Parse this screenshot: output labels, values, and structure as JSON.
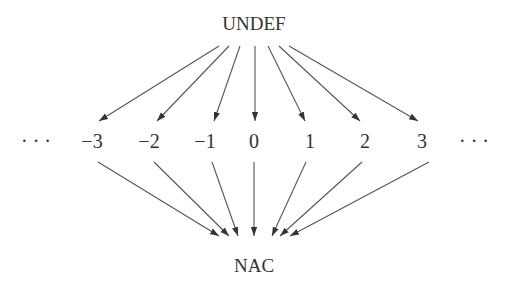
{
  "diagram": {
    "type": "lattice",
    "top": {
      "label": "UNDEF"
    },
    "bottom": {
      "label": "NAC"
    },
    "middle": {
      "left_ellipsis": "· · ·",
      "right_ellipsis": "· · ·",
      "values": [
        "−3",
        "−2",
        "−1",
        "0",
        "1",
        "2",
        "3"
      ]
    },
    "edges": [
      {
        "from": "UNDEF",
        "to": "−3"
      },
      {
        "from": "UNDEF",
        "to": "−2"
      },
      {
        "from": "UNDEF",
        "to": "−1"
      },
      {
        "from": "UNDEF",
        "to": "0"
      },
      {
        "from": "UNDEF",
        "to": "1"
      },
      {
        "from": "UNDEF",
        "to": "2"
      },
      {
        "from": "UNDEF",
        "to": "3"
      },
      {
        "from": "−3",
        "to": "NAC"
      },
      {
        "from": "−2",
        "to": "NAC"
      },
      {
        "from": "−1",
        "to": "NAC"
      },
      {
        "from": "0",
        "to": "NAC"
      },
      {
        "from": "1",
        "to": "NAC"
      },
      {
        "from": "2",
        "to": "NAC"
      },
      {
        "from": "3",
        "to": "NAC"
      }
    ],
    "colors": {
      "stroke": "#444444",
      "text": "#333333",
      "background": "#ffffff"
    }
  }
}
